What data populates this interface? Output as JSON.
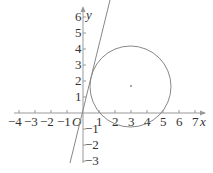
{
  "diagram": {
    "x_axis": {
      "label": "x",
      "ticks": [
        "-4",
        "-3",
        "-2",
        "-1",
        "1",
        "2",
        "3",
        "4",
        "5",
        "6",
        "7"
      ]
    },
    "y_axis": {
      "label": "y",
      "ticks": [
        "6",
        "5",
        "4",
        "3",
        "2",
        "1",
        "-1",
        "-2",
        "-3"
      ]
    },
    "origin_label": "O",
    "circle": {
      "center": [
        3,
        1.7
      ],
      "radius": 2.5
    },
    "tangent_line": {
      "through_origin": true
    },
    "colors": {
      "stroke": "#888888",
      "text": "#333333"
    }
  }
}
